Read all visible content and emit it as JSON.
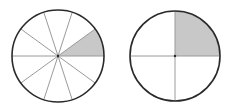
{
  "diagram": {
    "type": "fraction-circles",
    "colors": {
      "outline": "#2a2a2a",
      "spoke": "#9a9a9a",
      "shade": "#c8c8c8",
      "background": "#ffffff"
    },
    "circles": [
      {
        "id": "tenths-circle",
        "cx": 58,
        "cy": 56,
        "r": 46,
        "divisions": 10,
        "shaded_parts": 1,
        "fraction": "1/10"
      },
      {
        "id": "quarters-circle",
        "cx": 175,
        "cy": 56,
        "r": 45,
        "divisions": 4,
        "shaded_parts": 1,
        "fraction": "1/4"
      }
    ]
  }
}
